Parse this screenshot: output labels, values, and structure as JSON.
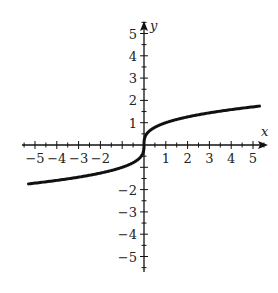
{
  "chart_data": {
    "type": "line",
    "title": "",
    "xlabel": "x",
    "ylabel": "y",
    "xlim": [
      -5.5,
      5.5
    ],
    "ylim": [
      -5.5,
      5.5
    ],
    "grid": false,
    "x_ticks": [
      -5,
      -4,
      -3,
      -2,
      -1,
      1,
      2,
      3,
      4,
      5
    ],
    "x_tick_labels": [
      "−5",
      "−4",
      "−3",
      "−2",
      "",
      "1",
      "2",
      "3",
      "4",
      "5"
    ],
    "y_ticks": [
      -5,
      -4,
      -3,
      -2,
      -1,
      1,
      2,
      3,
      4,
      5
    ],
    "y_tick_labels": [
      "−5",
      "−4",
      "−3",
      "−2",
      "",
      "1",
      "2",
      "3",
      "4",
      "5"
    ],
    "minor_ticks_per_unit": 2,
    "series": [
      {
        "name": "y = cube root of x",
        "x": [
          -5.5,
          -5,
          -4,
          -3,
          -2,
          -1,
          -0.5,
          -0.1,
          -0.01,
          0,
          0.01,
          0.1,
          0.5,
          1,
          2,
          3,
          4,
          5,
          5.5
        ],
        "values": [
          -1.77,
          -1.71,
          -1.59,
          -1.44,
          -1.26,
          -1.0,
          -0.79,
          -0.46,
          -0.22,
          0,
          0.22,
          0.46,
          0.79,
          1.0,
          1.26,
          1.44,
          1.59,
          1.71,
          1.77
        ]
      }
    ]
  },
  "labels": {
    "x_axis": "x",
    "y_axis": "y"
  }
}
